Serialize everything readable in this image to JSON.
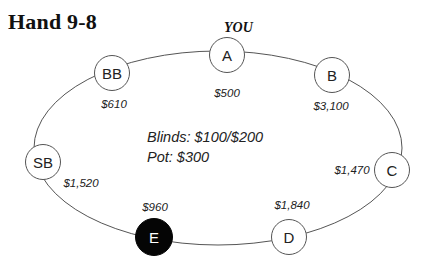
{
  "title": "Hand 9-8",
  "hero_label": "YOU",
  "info": {
    "blinds": "Blinds: $100/$200",
    "pot": "Pot: $300"
  },
  "colors": {
    "line": "#555555",
    "hero_seat_fill": "#050505",
    "seat_fill": "#ffffff"
  },
  "seats": [
    {
      "label": "A",
      "stack": "$500",
      "is_you": true
    },
    {
      "label": "B",
      "stack": "$3,100",
      "is_you": false
    },
    {
      "label": "C",
      "stack": "$1,470",
      "is_you": false
    },
    {
      "label": "D",
      "stack": "$1,840",
      "is_you": false
    },
    {
      "label": "E",
      "stack": "$960",
      "is_you": false,
      "highlighted": true
    },
    {
      "label": "SB",
      "stack": "$1,520",
      "is_you": false
    },
    {
      "label": "BB",
      "stack": "$610",
      "is_you": false
    }
  ]
}
